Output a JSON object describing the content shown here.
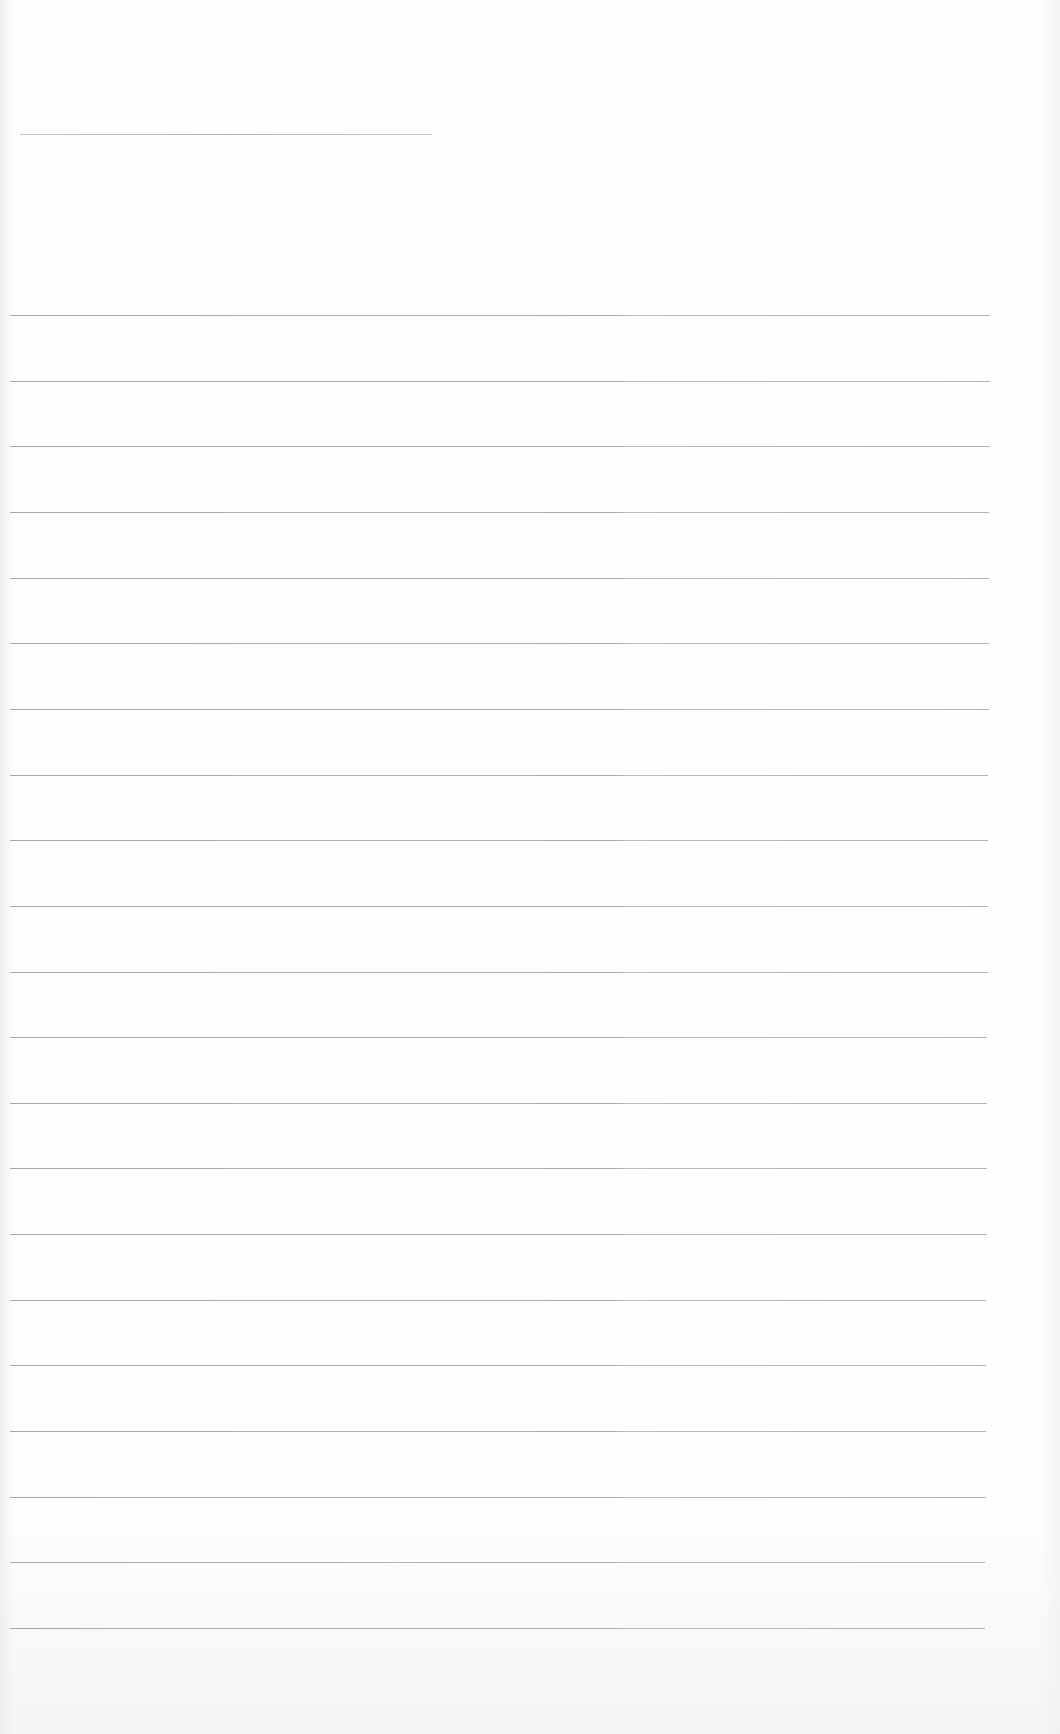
{
  "document": {
    "type": "ruled-paper",
    "background_color": "#fdfdfc",
    "line_color": "#a6a6a6",
    "title_line": {
      "left": 20,
      "top": 134,
      "width": 412
    },
    "ruled_lines": {
      "count": 21,
      "first_top": 315,
      "spacing": 65.65,
      "left": 10,
      "right_start": 990,
      "right_end": 985
    }
  }
}
